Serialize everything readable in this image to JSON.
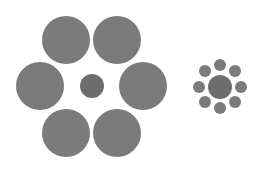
{
  "diagram": {
    "title": "",
    "colors": {
      "background": "#ffffff",
      "outer_circle": "#7b7b7b",
      "center_circle": "#6e6e6e"
    },
    "left_group": {
      "center": {
        "cx": 92,
        "cy": 86,
        "r": 12
      },
      "surround": [
        {
          "cx": 66,
          "cy": 40,
          "r": 24
        },
        {
          "cx": 117,
          "cy": 40,
          "r": 24
        },
        {
          "cx": 40,
          "cy": 86,
          "r": 24
        },
        {
          "cx": 143,
          "cy": 86,
          "r": 24
        },
        {
          "cx": 66,
          "cy": 133,
          "r": 24
        },
        {
          "cx": 117,
          "cy": 133,
          "r": 24
        }
      ]
    },
    "right_group": {
      "center": {
        "cx": 220,
        "cy": 87,
        "r": 12
      },
      "surround": [
        {
          "cx": 220,
          "cy": 65,
          "r": 6
        },
        {
          "cx": 235,
          "cy": 71,
          "r": 6
        },
        {
          "cx": 241,
          "cy": 87,
          "r": 6
        },
        {
          "cx": 235,
          "cy": 102,
          "r": 6
        },
        {
          "cx": 220,
          "cy": 108,
          "r": 6
        },
        {
          "cx": 205,
          "cy": 102,
          "r": 6
        },
        {
          "cx": 199,
          "cy": 87,
          "r": 6
        },
        {
          "cx": 205,
          "cy": 71,
          "r": 6
        }
      ]
    }
  }
}
